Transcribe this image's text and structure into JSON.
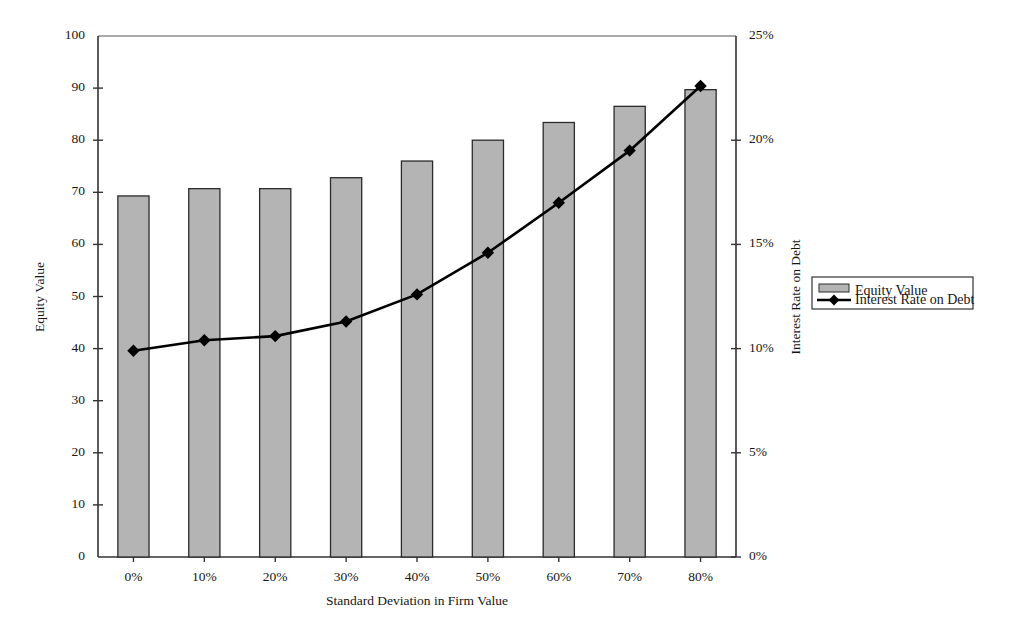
{
  "chart_data": {
    "type": "bar",
    "title": "",
    "categories": [
      "0%",
      "10%",
      "20%",
      "30%",
      "40%",
      "50%",
      "60%",
      "70%",
      "80%"
    ],
    "xlabel": "Standard Deviation in Firm Value",
    "ylabel": "Equity Value",
    "y2label": "Interest Rate on Debt",
    "ylim": [
      0,
      100
    ],
    "y2lim": [
      0,
      25
    ],
    "yticks": [
      "0",
      "10",
      "20",
      "30",
      "40",
      "50",
      "60",
      "70",
      "80",
      "90",
      "100"
    ],
    "y2ticks": [
      "0%",
      "5%",
      "10%",
      "15%",
      "20%",
      "25%"
    ],
    "grid": false,
    "legend_position": "right-outside",
    "series": [
      {
        "name": "Equity Value",
        "kind": "bar",
        "axis": "left",
        "color": "#b4b4b4",
        "values": [
          69.3,
          70.7,
          70.7,
          72.8,
          76.0,
          80.0,
          83.4,
          86.5,
          89.7
        ]
      },
      {
        "name": "Interest Rate on Debt",
        "kind": "line",
        "axis": "right",
        "color": "#000000",
        "marker": "diamond",
        "values": [
          9.9,
          10.4,
          10.6,
          11.3,
          12.6,
          14.6,
          17.0,
          19.5,
          22.6
        ]
      }
    ]
  },
  "legend": {
    "items": [
      {
        "label": "Equity Value",
        "swatch": "bar-swatch"
      },
      {
        "label": "Interest Rate on Debt",
        "swatch": "line-diamond-swatch"
      }
    ]
  }
}
